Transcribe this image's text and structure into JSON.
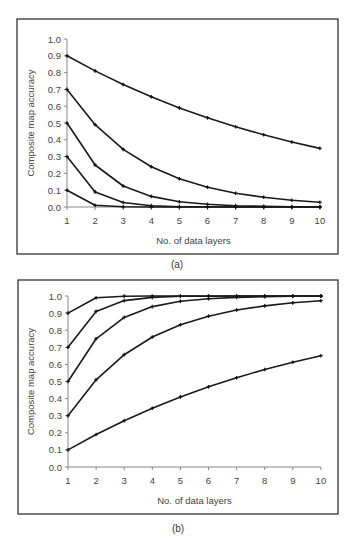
{
  "chart_data": [
    {
      "panel": "a",
      "type": "line",
      "title": "",
      "caption": "(a)",
      "xlabel": "No. of data layers",
      "ylabel": "Composite map accuracy",
      "x": [
        1,
        2,
        3,
        4,
        5,
        6,
        7,
        8,
        9,
        10
      ],
      "ylim": [
        0,
        1.0
      ],
      "yticks": [
        "0.0",
        "0.1",
        "0.2",
        "0.3",
        "0.4",
        "0.5",
        "0.6",
        "0.7",
        "0.8",
        "0.9",
        "1.0"
      ],
      "xticks": [
        "1",
        "2",
        "3",
        "4",
        "5",
        "6",
        "7",
        "8",
        "9",
        "10"
      ],
      "grid": false,
      "legend": "none",
      "series": [
        {
          "name": "p=0.9",
          "values": [
            0.9,
            0.81,
            0.729,
            0.656,
            0.59,
            0.531,
            0.478,
            0.43,
            0.387,
            0.349
          ]
        },
        {
          "name": "p=0.7",
          "values": [
            0.7,
            0.49,
            0.343,
            0.24,
            0.168,
            0.118,
            0.082,
            0.058,
            0.04,
            0.028
          ]
        },
        {
          "name": "p=0.5",
          "values": [
            0.5,
            0.25,
            0.125,
            0.063,
            0.031,
            0.016,
            0.008,
            0.004,
            0.002,
            0.001
          ]
        },
        {
          "name": "p=0.3",
          "values": [
            0.3,
            0.09,
            0.027,
            0.008,
            0.002,
            0.001,
            0.0,
            0.0,
            0.0,
            0.0
          ]
        },
        {
          "name": "p=0.1",
          "values": [
            0.1,
            0.01,
            0.001,
            0.0,
            0.0,
            0.0,
            0.0,
            0.0,
            0.0,
            0.0
          ]
        }
      ]
    },
    {
      "panel": "b",
      "type": "line",
      "title": "",
      "caption": "(b)",
      "xlabel": "No. of data layers",
      "ylabel": "Composite map accuracy",
      "x": [
        1,
        2,
        3,
        4,
        5,
        6,
        7,
        8,
        9,
        10
      ],
      "ylim": [
        0,
        1.0
      ],
      "yticks": [
        "0.0",
        "0.1",
        "0.2",
        "0.3",
        "0.4",
        "0.5",
        "0.6",
        "0.7",
        "0.8",
        "0.9",
        "1.0"
      ],
      "xticks": [
        "1",
        "2",
        "3",
        "4",
        "5",
        "6",
        "7",
        "8",
        "9",
        "10"
      ],
      "grid": false,
      "legend": "none",
      "series": [
        {
          "name": "p=0.9",
          "values": [
            0.9,
            0.99,
            0.999,
            1.0,
            1.0,
            1.0,
            1.0,
            1.0,
            1.0,
            1.0
          ]
        },
        {
          "name": "p=0.7",
          "values": [
            0.7,
            0.91,
            0.973,
            0.992,
            0.998,
            0.999,
            1.0,
            1.0,
            1.0,
            1.0
          ]
        },
        {
          "name": "p=0.5",
          "values": [
            0.5,
            0.75,
            0.875,
            0.938,
            0.969,
            0.984,
            0.992,
            0.996,
            0.998,
            0.999
          ]
        },
        {
          "name": "p=0.3",
          "values": [
            0.3,
            0.51,
            0.657,
            0.76,
            0.832,
            0.882,
            0.918,
            0.942,
            0.96,
            0.972
          ]
        },
        {
          "name": "p=0.1",
          "values": [
            0.1,
            0.19,
            0.271,
            0.344,
            0.41,
            0.469,
            0.522,
            0.57,
            0.613,
            0.651
          ]
        }
      ]
    }
  ],
  "captions": {
    "a": "(a)",
    "b": "(b)"
  }
}
